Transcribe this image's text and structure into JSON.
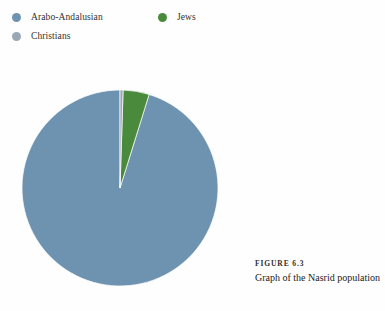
{
  "figure": {
    "caption_number": "FIGURE 6.3",
    "caption_text": "Graph of the Nasrid population"
  },
  "legend": {
    "items": [
      {
        "label": "Arabo-Andalusian",
        "color": "#6e93b0",
        "icon": "circle-swatch-icon"
      },
      {
        "label": "Jews",
        "color": "#4a8a3c",
        "icon": "circle-swatch-icon"
      },
      {
        "label": "Christians",
        "color": "#9aa7b4",
        "icon": "circle-swatch-icon"
      }
    ]
  },
  "chart_data": {
    "type": "pie",
    "title": "Graph of the Nasrid population",
    "categories": [
      "Arabo-Andalusian",
      "Jews",
      "Christians"
    ],
    "values": [
      95.2,
      4.3,
      0.5
    ],
    "unit": "percent",
    "colors": [
      "#6e93b0",
      "#4a8a3c",
      "#9aa7b4"
    ],
    "start_angle_deg": -90,
    "direction": "counterclockwise",
    "legend_position": "top-left",
    "grid": false,
    "labels_shown": false,
    "center": {
      "x": 98,
      "y": 128
    },
    "radius": 98
  },
  "colors": {
    "background": "#fefefe",
    "arabo_andalusian": "#6e93b0",
    "jews": "#4a8a3c",
    "christians": "#9aa7b4",
    "text": "#232323"
  }
}
